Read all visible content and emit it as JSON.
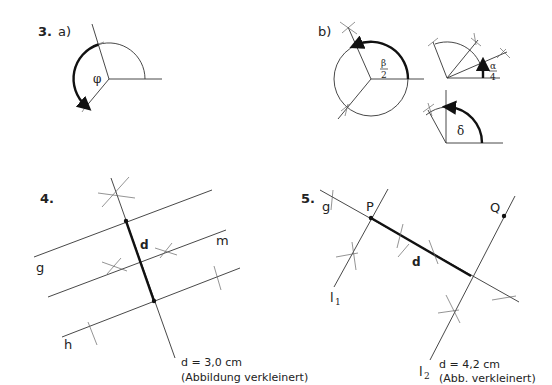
{
  "exercise3": {
    "number": "3.",
    "part_a": {
      "label": "a)",
      "angle_label": "φ"
    },
    "part_b": {
      "label": "b)",
      "circle_angle": {
        "num": "β",
        "den": "2"
      },
      "quarter_angle": {
        "num": "α",
        "den": "4"
      },
      "right_angle_label": "δ"
    }
  },
  "exercise4": {
    "number": "4.",
    "lines": {
      "g": "g",
      "m": "m",
      "h": "h"
    },
    "segment_label": "d",
    "caption_line1": "d = 3,0 cm",
    "caption_line2": "(Abbildung verkleinert)"
  },
  "exercise5": {
    "number": "5.",
    "line_g": "g",
    "point_p": "P",
    "point_q": "Q",
    "line_l1": "l",
    "line_l1_sub": "1",
    "line_l2": "l",
    "line_l2_sub": "2",
    "segment_label": "d",
    "caption_line1": "d = 4,2 cm",
    "caption_line2": "(Abb. verkleinert)"
  },
  "colors": {
    "ink": "#222222",
    "background": "#ffffff"
  }
}
